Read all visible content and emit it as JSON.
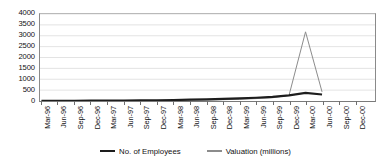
{
  "chart_data": {
    "type": "line",
    "title": "",
    "xlabel": "",
    "ylabel": "",
    "ylim": [
      0,
      4000
    ],
    "ytick_interval": 500,
    "yticks": [
      "0",
      "500",
      "1000",
      "1500",
      "2000",
      "2500",
      "3000",
      "3500",
      "4000"
    ],
    "grid": true,
    "legend_position": "bottom-center",
    "categories": [
      "Mar-96",
      "Jun-96",
      "Sep-96",
      "Dec-96",
      "Mar-97",
      "Jun-97",
      "Sep-97",
      "Dec-97",
      "Mar-98",
      "Jun-98",
      "Sep-98",
      "Dec-98",
      "Mar-99",
      "Jun-99",
      "Sep-99",
      "Dec-99",
      "Mar-00",
      "Jun-00",
      "Sep-00",
      "Dec-00"
    ],
    "series": [
      {
        "name": "No. of Employees",
        "color": "#1d1d1d",
        "line_width": 2.2,
        "values": [
          5,
          8,
          10,
          14,
          18,
          22,
          28,
          35,
          45,
          60,
          75,
          95,
          120,
          150,
          190,
          260,
          370,
          300,
          null,
          null
        ]
      },
      {
        "name": "Valuation (millions)",
        "color": "#8c8c8c",
        "line_width": 1.0,
        "values": [
          2,
          3,
          4,
          6,
          8,
          10,
          14,
          18,
          25,
          35,
          45,
          60,
          80,
          110,
          150,
          260,
          3180,
          420,
          null,
          null
        ]
      }
    ],
    "annotations": [
      {
        "text": "Valuation spike peaks near Mar-00 at approximately 3180 million",
        "x": "Mar-00",
        "y": 3180
      }
    ]
  },
  "legend": {
    "items": [
      {
        "label": "No. of Employees",
        "marker": "thick-line-marker",
        "color": "#1d1d1d"
      },
      {
        "label": "Valuation (millions)",
        "marker": "thin-line-marker",
        "color": "#8c8c8c"
      }
    ]
  },
  "colors": {
    "background": "#ffffff",
    "gridline": "#d7d7d7",
    "axis": "#7a7a7a",
    "text": "#111111",
    "employees_series": "#1d1d1d",
    "valuation_series": "#8c8c8c"
  }
}
